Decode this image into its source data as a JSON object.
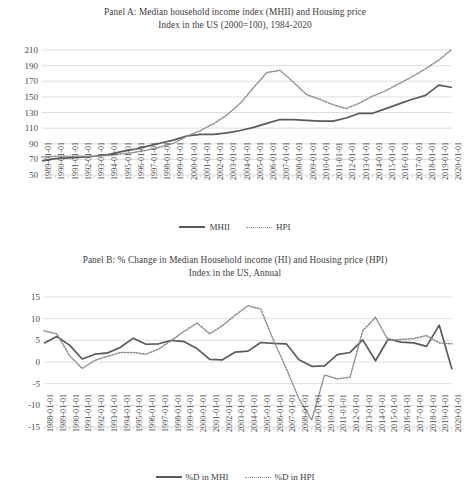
{
  "figure": {
    "panels": [
      {
        "id": "panel-a",
        "title_line1": "Panel A: Median household income index (MHII) and Housing price",
        "title_line2": "Index in the US (2000=100), 1984-2020",
        "legend": [
          {
            "label": "MHII",
            "style": "solid",
            "color": "#5a5a5a"
          },
          {
            "label": "HPI",
            "style": "dotted",
            "color": "#8c8c8c"
          }
        ]
      },
      {
        "id": "panel-b",
        "title_line1": "Panel B: % Change in Median Household income (HI) and Housing price (HPI)",
        "title_line2": "Index in the US, Annual",
        "legend": [
          {
            "label": "%D in MHI",
            "style": "solid",
            "color": "#5a5a5a"
          },
          {
            "label": "%D in HPI",
            "style": "dotted",
            "color": "#8c8c8c"
          }
        ]
      }
    ]
  },
  "chart_data": [
    {
      "type": "line",
      "panel": "Panel A",
      "title": "Panel A: Median household income index (MHII) and Housing price Index in the US (2000=100), 1984-2020",
      "xlabel": "",
      "ylabel": "",
      "ylim": [
        50,
        210
      ],
      "yticks": [
        50,
        70,
        90,
        110,
        130,
        150,
        170,
        190,
        210
      ],
      "grid": true,
      "legend_position": "bottom",
      "x": [
        "1989-01-01",
        "1990-01-01",
        "1991-01-01",
        "1992-01-01",
        "1993-01-01",
        "1994-01-01",
        "1995-01-01",
        "1996-01-01",
        "1997-01-01",
        "1998-01-01",
        "1999-01-01",
        "2000-01-01",
        "2001-01-01",
        "2002-01-01",
        "2003-01-01",
        "2004-01-01",
        "2005-01-01",
        "2006-01-01",
        "2007-01-01",
        "2008-01-01",
        "2009-01-01",
        "2010-01-01",
        "2011-01-01",
        "2012-01-01",
        "2013-01-01",
        "2014-01-01",
        "2015-01-01",
        "2016-01-01",
        "2017-01-01",
        "2018-01-01",
        "2019-01-01",
        "2020-01-01"
      ],
      "series": [
        {
          "name": "MHII",
          "style": "solid",
          "color": "#5a5a5a",
          "values": [
            68,
            71,
            72,
            73,
            74,
            76,
            80,
            83,
            87,
            91,
            95,
            100,
            102,
            102,
            104,
            107,
            111,
            116,
            121,
            121,
            120,
            119,
            119,
            123,
            129,
            129,
            135,
            141,
            147,
            152,
            165,
            162
          ]
        },
        {
          "name": "HPI",
          "style": "dotted",
          "color": "#8c8c8c",
          "values": [
            73,
            74,
            74,
            74,
            74,
            75,
            77,
            79,
            82,
            86,
            91,
            100,
            107,
            116,
            127,
            142,
            162,
            181,
            184,
            169,
            153,
            147,
            140,
            135,
            142,
            151,
            158,
            167,
            176,
            186,
            197,
            211
          ]
        }
      ]
    },
    {
      "type": "line",
      "panel": "Panel B",
      "title": "Panel B: % Change in Median Household income (HI) and Housing price (HPI) Index in the US, Annual",
      "xlabel": "",
      "ylabel": "",
      "ylim": [
        -15,
        15
      ],
      "yticks": [
        -15,
        -10,
        -5,
        0,
        5,
        10,
        15
      ],
      "grid": true,
      "legend_position": "bottom",
      "x": [
        "1988-01-01",
        "1989-01-01",
        "1990-01-01",
        "1991-01-01",
        "1992-01-01",
        "1993-01-01",
        "1994-01-01",
        "1995-01-01",
        "1996-01-01",
        "1997-01-01",
        "1998-01-01",
        "1999-01-01",
        "2000-01-01",
        "2001-01-01",
        "2002-01-01",
        "2003-01-01",
        "2004-01-01",
        "2005-01-01",
        "2006-01-01",
        "2007-01-01",
        "2008-01-01",
        "2009-01-01",
        "2010-01-01",
        "2011-01-01",
        "2012-01-01",
        "2013-01-01",
        "2014-01-01",
        "2015-01-01",
        "2016-01-01",
        "2017-01-01",
        "2018-01-01",
        "2019-01-01",
        "2020-01-01"
      ],
      "series": [
        {
          "name": "%D in MHI",
          "style": "solid",
          "color": "#5a5a5a",
          "values": [
            4.3,
            5.9,
            3.9,
            0.7,
            1.8,
            2.1,
            3.4,
            5.5,
            4.1,
            4.2,
            5.0,
            4.7,
            3.1,
            0.6,
            0.5,
            2.3,
            2.5,
            4.5,
            4.3,
            4.2,
            0.5,
            -1.0,
            -0.9,
            1.7,
            2.2,
            5.1,
            0.3,
            5.3,
            4.6,
            4.4,
            3.6,
            8.5,
            -1.7
          ]
        },
        {
          "name": "%D in HPI",
          "style": "dotted",
          "color": "#8c8c8c",
          "values": [
            7.2,
            6.5,
            1.5,
            -1.5,
            0.4,
            1.3,
            2.2,
            2.2,
            1.8,
            3.0,
            5.0,
            7.1,
            9.0,
            6.5,
            8.4,
            10.8,
            13.0,
            12.2,
            5.0,
            -1.5,
            -8.5,
            -13.4,
            -3.0,
            -3.9,
            -3.5,
            7.2,
            10.3,
            5.0,
            5.2,
            5.4,
            6.1,
            4.4,
            4.2
          ]
        }
      ]
    }
  ]
}
